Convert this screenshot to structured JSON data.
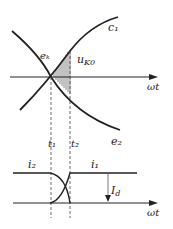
{
  "diagram": {
    "upper_graph": {
      "x_axis_label": "ωt",
      "curves": [
        {
          "id": "rising",
          "label": "c₁",
          "label_note": "reads as c₁ in screenshot; likely e₁ by convention (pairs with e₂) but not confirmed at this resolution"
        },
        {
          "id": "falling",
          "label": "e₂"
        }
      ],
      "intersection_label": "eₖ",
      "hatched_area_label": "u_K0",
      "hatched_area_label_main": "u",
      "hatched_area_label_sub": "K0"
    },
    "time_markers": [
      {
        "label": "t₁"
      },
      {
        "label": "t₂"
      }
    ],
    "lower_graph": {
      "x_axis_label": "ωt",
      "current_labels": {
        "before": "i₂",
        "after": "i₁"
      },
      "magnitude_label": "I_d",
      "magnitude_label_main": "I",
      "magnitude_label_sub": "d"
    }
  }
}
